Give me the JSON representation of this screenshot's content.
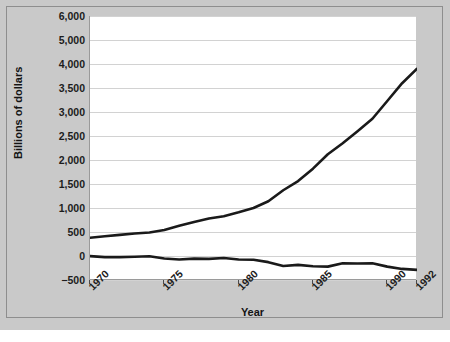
{
  "chart_data": {
    "type": "line",
    "title": "",
    "xlabel": "Year",
    "ylabel": "Billions of dollars",
    "grid": true,
    "legend": "none",
    "x": [
      1970,
      1971,
      1972,
      1973,
      1974,
      1975,
      1976,
      1977,
      1978,
      1979,
      1980,
      1981,
      1982,
      1983,
      1984,
      1985,
      1986,
      1987,
      1988,
      1989,
      1990,
      1991,
      1992
    ],
    "xlim": [
      1970,
      1992
    ],
    "xticks": [
      "1970",
      "1975",
      "1980",
      "1985",
      "1990",
      "1992"
    ],
    "xtick_values": [
      1970,
      1975,
      1980,
      1985,
      1990,
      1992
    ],
    "yticks": [
      "6,000",
      "5,000",
      "4,000",
      "3,500",
      "3,000",
      "2,500",
      "2,000",
      "1,500",
      "1,000",
      "500",
      "0",
      "-500"
    ],
    "ytick_values": [
      6000,
      5000,
      4000,
      3500,
      3000,
      2500,
      2000,
      1500,
      1000,
      500,
      0,
      -500
    ],
    "ylim": [
      -500,
      6000
    ],
    "series": [
      {
        "name": "Gross federal debt",
        "values": [
          380,
          410,
          440,
          470,
          490,
          540,
          630,
          710,
          780,
          830,
          910,
          1000,
          1140,
          1370,
          1560,
          1820,
          2120,
          2350,
          2600,
          2860,
          3230,
          3600,
          3900
        ]
      },
      {
        "name": "Federal deficit",
        "values": [
          -3,
          -23,
          -23,
          -15,
          -6,
          -53,
          -74,
          -54,
          -59,
          -41,
          -74,
          -79,
          -128,
          -208,
          -185,
          -212,
          -221,
          -150,
          -155,
          -152,
          -221,
          -269,
          -290
        ]
      }
    ]
  },
  "axes": {
    "y_title": "Billions of dollars",
    "x_title": "Year"
  },
  "caption": {
    "text": ""
  }
}
